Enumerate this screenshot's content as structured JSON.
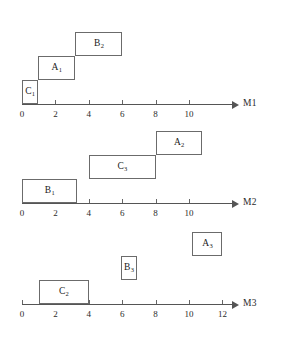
{
  "figure": {
    "type": "gantt",
    "origin_x_px": 22,
    "px_per_unit": 16.7,
    "box_height_px": 24,
    "colors": {
      "line": "#555555",
      "box_border": "#6b6b6b",
      "box_fill": "#ffffff",
      "text": "#1a1a1a",
      "background": "#ffffff"
    }
  },
  "machines": [
    {
      "id": "M1",
      "axis_label": "M1",
      "baseline_y": 104,
      "axis_start_x": 22,
      "axis_end_x": 232,
      "label_x": 243,
      "ticks": [
        {
          "value": 0,
          "label": "0"
        },
        {
          "value": 2,
          "label": "2"
        },
        {
          "value": 4,
          "label": "4"
        },
        {
          "value": 6,
          "label": "6"
        },
        {
          "value": 8,
          "label": "8"
        },
        {
          "value": 10,
          "label": "10"
        }
      ],
      "jobs": [
        {
          "name": "C1",
          "base": "C",
          "sub": "1",
          "start": 0.0,
          "end": 0.95,
          "level": 0
        },
        {
          "name": "A1",
          "base": "A",
          "sub": "1",
          "start": 0.95,
          "end": 3.2,
          "level": 1
        },
        {
          "name": "B2",
          "base": "B",
          "sub": "2",
          "start": 3.2,
          "end": 6.0,
          "level": 2
        }
      ]
    },
    {
      "id": "M2",
      "axis_label": "M2",
      "baseline_y": 203,
      "axis_start_x": 22,
      "axis_end_x": 232,
      "label_x": 243,
      "ticks": [
        {
          "value": 0,
          "label": "0"
        },
        {
          "value": 2,
          "label": "2"
        },
        {
          "value": 4,
          "label": "4"
        },
        {
          "value": 6,
          "label": "6"
        },
        {
          "value": 8,
          "label": "8"
        },
        {
          "value": 10,
          "label": "10"
        }
      ],
      "jobs": [
        {
          "name": "B1",
          "base": "B",
          "sub": "1",
          "start": 0.0,
          "end": 3.3,
          "level": 0
        },
        {
          "name": "C3",
          "base": "C",
          "sub": "3",
          "start": 4.0,
          "end": 8.0,
          "level": 1
        },
        {
          "name": "A2",
          "base": "A",
          "sub": "2",
          "start": 8.0,
          "end": 10.8,
          "level": 2
        }
      ]
    },
    {
      "id": "M3",
      "axis_label": "M3",
      "baseline_y": 304,
      "axis_start_x": 22,
      "axis_end_x": 232,
      "label_x": 243,
      "ticks": [
        {
          "value": 0,
          "label": "0"
        },
        {
          "value": 2,
          "label": "2"
        },
        {
          "value": 4,
          "label": "4"
        },
        {
          "value": 6,
          "label": "6"
        },
        {
          "value": 8,
          "label": "8"
        },
        {
          "value": 10,
          "label": "10"
        },
        {
          "value": 12,
          "label": "12"
        }
      ],
      "jobs": [
        {
          "name": "C2",
          "base": "C",
          "sub": "2",
          "start": 1.0,
          "end": 4.0,
          "level": 0
        },
        {
          "name": "B3",
          "base": "B",
          "sub": "3",
          "start": 5.9,
          "end": 6.9,
          "level": 1
        },
        {
          "name": "A3",
          "base": "A",
          "sub": "3",
          "start": 10.2,
          "end": 12.0,
          "level": 2
        }
      ]
    }
  ]
}
